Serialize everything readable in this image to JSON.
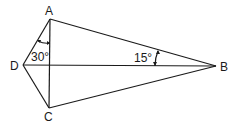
{
  "diagram": {
    "type": "geometry-kite",
    "points": {
      "A": {
        "label": "A",
        "x": 50,
        "y": 19
      },
      "B": {
        "label": "B",
        "x": 216,
        "y": 66
      },
      "C": {
        "label": "C",
        "x": 49,
        "y": 108
      },
      "D": {
        "label": "D",
        "x": 23,
        "y": 65
      }
    },
    "segments": [
      "AB",
      "BC",
      "CD",
      "DA",
      "AC",
      "DB"
    ],
    "angles": [
      {
        "label": "30°",
        "at": "A",
        "between": [
          "AD",
          "AC"
        ]
      },
      {
        "label": "15°",
        "at": "B",
        "between": [
          "BA",
          "BD"
        ]
      }
    ],
    "stroke_color": "#1a1a1a"
  }
}
